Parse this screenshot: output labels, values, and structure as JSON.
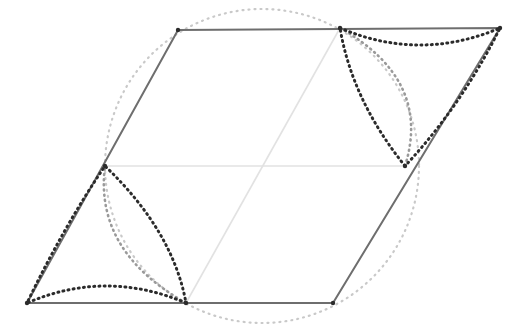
{
  "figure": {
    "canvas": {
      "width": 511,
      "height": 335,
      "background": "#ffffff"
    },
    "colors": {
      "solid_edge": "#6e6e6e",
      "faint_line": "#e2e2e2",
      "faint_dotted": "#c9c9c9",
      "dark_dotted": "#2b2b2b"
    },
    "vertices": {
      "top_left": {
        "label": "A",
        "x": 178,
        "y": 30
      },
      "top_right": {
        "label": "B",
        "x": 500,
        "y": 28
      },
      "bottom_right": {
        "label": "C",
        "x": 333,
        "y": 303
      },
      "bottom_left": {
        "label": "D",
        "x": 27,
        "y": 303
      },
      "mid_left": {
        "label": "E",
        "x": 105,
        "y": 166
      },
      "mid_right": {
        "label": "F",
        "x": 405,
        "y": 166
      },
      "mid_top": {
        "label": "G",
        "x": 340,
        "y": 28
      },
      "mid_bottom": {
        "label": "H",
        "x": 186,
        "y": 303
      }
    },
    "circle": {
      "center_x": 262,
      "center_y": 166,
      "radius": 157,
      "style": "dotted",
      "stroke": "#c9c9c9",
      "stroke_width": 2.2,
      "dash": "1 5"
    },
    "rhombus": {
      "style": "solid",
      "stroke": "#6e6e6e",
      "stroke_width": 2,
      "path": "M 178 30 L 500 28 L 333 303 L 27 303 Z"
    },
    "interior_lines": [
      {
        "name": "horizontal-midline",
        "path": "M 105 166 L 405 166",
        "stroke": "#e2e2e2",
        "stroke_width": 1.6
      },
      {
        "name": "long-diagonal",
        "path": "M 186 303 L 340 28",
        "stroke": "#e2e2e2",
        "stroke_width": 1.6
      }
    ],
    "curved_triangles": [
      {
        "name": "top-right-curved-triangle",
        "corner": "top_right",
        "outer_path": "M 340 28 Q 420 62 500 28 Q 462 105 405 166 Q 352 100 340 28 Z",
        "inner_arc_path": "M 340 28 Q 432 80 405 166",
        "stroke": "#2b2b2b",
        "stroke_width": 3,
        "dash": "1 4.2",
        "inner_stroke": "#9a9a9a",
        "inner_stroke_width": 2.6,
        "inner_dash": "1 4.2"
      },
      {
        "name": "bottom-left-curved-triangle",
        "corner": "bottom_left",
        "outer_path": "M 186 303 Q 106 269 27 303 Q 64 226 105 166 Q 173 231 186 303 Z",
        "inner_arc_path": "M 186 303 Q 94 251 105 166",
        "stroke": "#2b2b2b",
        "stroke_width": 3,
        "dash": "1 4.2",
        "inner_stroke": "#9a9a9a",
        "inner_stroke_width": 2.6,
        "inner_dash": "1 4.2"
      }
    ],
    "vertex_dots": [
      {
        "x": 178,
        "y": 30
      },
      {
        "x": 500,
        "y": 28
      },
      {
        "x": 333,
        "y": 303
      },
      {
        "x": 27,
        "y": 303
      },
      {
        "x": 340,
        "y": 28
      },
      {
        "x": 186,
        "y": 303
      },
      {
        "x": 405,
        "y": 166
      },
      {
        "x": 105,
        "y": 166
      }
    ]
  }
}
